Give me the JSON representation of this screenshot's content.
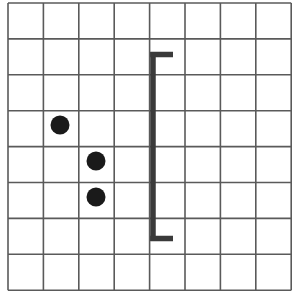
{
  "figure": {
    "title": "",
    "background_color": "#ffffff",
    "width": 295,
    "height": 299,
    "grid": {
      "name": "square-grid",
      "columns": 8,
      "rows": 8,
      "x_start": 8,
      "y_start": 3,
      "cell_width": 35.4,
      "cell_height": 35.9,
      "line_color": "#5a5a5a",
      "line_width": 1.6,
      "x_lines": [
        8,
        43.4,
        78.8,
        114.2,
        149.6,
        185.0,
        220.4,
        255.8,
        291.2
      ],
      "y_lines": [
        3,
        38.9,
        74.8,
        110.7,
        146.6,
        182.5,
        218.4,
        254.3,
        290.2
      ]
    },
    "dots": [
      {
        "name": "dot-1",
        "cx": 60,
        "cy": 125,
        "r": 9.5,
        "color": "#1a1a1a"
      },
      {
        "name": "dot-2",
        "cx": 96,
        "cy": 161,
        "r": 9.5,
        "color": "#1a1a1a"
      },
      {
        "name": "dot-3",
        "cx": 96,
        "cy": 197,
        "r": 9.5,
        "color": "#1a1a1a"
      }
    ],
    "bracket": {
      "name": "left-square-bracket",
      "color": "#3a3a3a",
      "stem_x": 153,
      "stem_top": 52,
      "stem_bottom": 241,
      "stem_thickness": 5.5,
      "arm_length": 20,
      "arm_thickness": 5.5,
      "top_arm_y": 54.5,
      "bottom_arm_y": 238.5,
      "arm_end_x": 173
    }
  },
  "chart_data": {
    "type": "scatter",
    "title": "",
    "xlabel": "",
    "ylabel": "",
    "grid": true,
    "legend": "none",
    "xlim": [
      0,
      8
    ],
    "ylim": [
      0,
      8
    ],
    "series": [
      {
        "name": "dots",
        "marker": "filled-circle",
        "color": "#1a1a1a",
        "points": [
          {
            "grid_col": 2,
            "grid_row": 4,
            "x": 1.5,
            "y": 4.6
          },
          {
            "grid_col": 3,
            "grid_row": 5,
            "x": 2.5,
            "y": 3.6
          },
          {
            "grid_col": 3,
            "grid_row": 6,
            "x": 2.5,
            "y": 2.6
          }
        ]
      }
    ],
    "annotations": [
      {
        "name": "left-square-bracket",
        "type": "bracket",
        "orientation": "left",
        "x": 4.1,
        "y_top": 6.6,
        "y_bottom": 1.4,
        "color": "#3a3a3a"
      }
    ]
  }
}
